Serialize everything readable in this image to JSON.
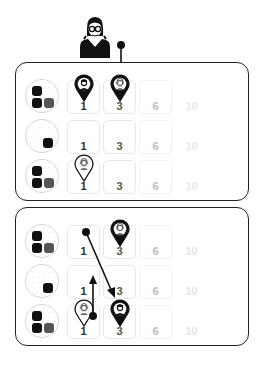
{
  "figure": {
    "top_character": {
      "label": "woman with glasses portrait"
    },
    "panels": [
      {
        "id": "panel-1",
        "rows": [
          {
            "dice_count": 3,
            "cells": [
              "1",
              "3",
              "6",
              "10"
            ]
          },
          {
            "dice_count": 1,
            "cells": [
              "1",
              "3",
              "6",
              "10"
            ]
          },
          {
            "dice_count": 3,
            "cells": [
              "1",
              "3",
              "6",
              "10"
            ]
          }
        ],
        "pins": [
          {
            "row": 1,
            "cell": "1",
            "style": "dark",
            "character": "man"
          },
          {
            "row": 1,
            "cell": "3",
            "style": "dark",
            "character": "woman"
          },
          {
            "row": 3,
            "cell": "1",
            "style": "light",
            "character": "woman"
          }
        ],
        "arrows": [
          {
            "from": "top-character",
            "to": "row1-cell3",
            "direction": "down"
          }
        ]
      },
      {
        "id": "panel-2",
        "rows": [
          {
            "dice_count": 3,
            "cells": [
              "1",
              "3",
              "6",
              "10"
            ]
          },
          {
            "dice_count": 1,
            "cells": [
              "1",
              "3",
              "6",
              "10"
            ]
          },
          {
            "dice_count": 3,
            "cells": [
              "1",
              "3",
              "6",
              "10"
            ]
          }
        ],
        "pins": [
          {
            "row": 1,
            "cell": "3",
            "style": "dark",
            "character": "woman"
          },
          {
            "row": 3,
            "cell": "1",
            "style": "light",
            "character": "woman"
          },
          {
            "row": 3,
            "cell": "3",
            "style": "dark",
            "character": "man"
          }
        ],
        "arrows": [
          {
            "from": "row1-cell1",
            "to": "row3-cell3",
            "direction": "diagonal-down"
          },
          {
            "from": "row3-cell1",
            "to": "row2-cell1",
            "direction": "up"
          }
        ]
      }
    ]
  },
  "labels": {
    "p1": {
      "r1": [
        "1",
        "3",
        "6",
        "10"
      ],
      "r2": [
        "1",
        "3",
        "6",
        "10"
      ],
      "r3": [
        "1",
        "3",
        "6",
        "10"
      ]
    },
    "p2": {
      "r1": [
        "1",
        "3",
        "6",
        "10"
      ],
      "r2": [
        "1",
        "3",
        "6",
        "10"
      ],
      "r3": [
        "1",
        "3",
        "6",
        "10"
      ]
    }
  },
  "colors": {
    "num_1": "#333333",
    "num_3": "#555555",
    "num_6": "#bdbdbd",
    "num_10": "#e6e6e6",
    "outline": "#222222"
  }
}
